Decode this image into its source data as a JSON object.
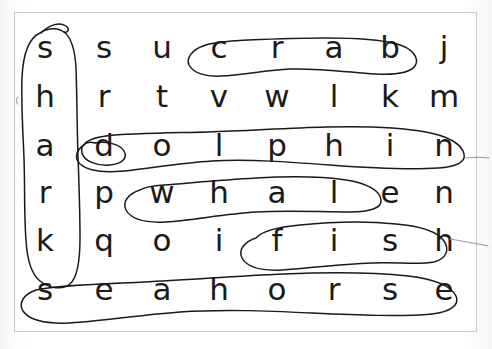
{
  "page": {
    "type": "word-search-puzzle",
    "background_color": "#ffffff",
    "border_color": "#c9c9c5",
    "ink_color": "#1a1a1a",
    "letter_color": "#1b1b1b"
  },
  "grid": {
    "rows": 6,
    "columns": 8,
    "letters": [
      [
        "s",
        "s",
        "u",
        "c",
        "r",
        "a",
        "b",
        "j"
      ],
      [
        "h",
        "r",
        "t",
        "v",
        "w",
        "l",
        "k",
        "m"
      ],
      [
        "a",
        "d",
        "o",
        "l",
        "p",
        "h",
        "i",
        "n"
      ],
      [
        "r",
        "p",
        "w",
        "h",
        "a",
        "l",
        "e",
        "n"
      ],
      [
        "k",
        "q",
        "o",
        "i",
        "f",
        "i",
        "s",
        "h"
      ],
      [
        "s",
        "e",
        "a",
        "h",
        "o",
        "r",
        "s",
        "e"
      ]
    ],
    "row_labels": [
      "row-1",
      "row-2",
      "row-3",
      "row-4",
      "row-5",
      "row-6"
    ],
    "column_positions": [
      45,
      104,
      162,
      219,
      277,
      334,
      390,
      444
    ],
    "row_positions": [
      47,
      96,
      145,
      192,
      240,
      289
    ]
  },
  "found_words": [
    {
      "word": "shark",
      "direction": "vertical",
      "start": {
        "row": 1,
        "column": 1
      },
      "end": {
        "row": 5,
        "column": 1
      },
      "marking": "hand-drawn-ellipse"
    },
    {
      "word": "crab",
      "direction": "horizontal",
      "start": {
        "row": 1,
        "column": 4
      },
      "end": {
        "row": 1,
        "column": 7
      },
      "marking": "hand-drawn-ellipse"
    },
    {
      "word": "dolphin",
      "direction": "horizontal",
      "start": {
        "row": 3,
        "column": 2
      },
      "end": {
        "row": 3,
        "column": 8
      },
      "marking": "hand-drawn-ellipse"
    },
    {
      "word": "whale",
      "direction": "horizontal",
      "start": {
        "row": 4,
        "column": 3
      },
      "end": {
        "row": 4,
        "column": 7
      },
      "marking": "hand-drawn-ellipse"
    },
    {
      "word": "fish",
      "direction": "horizontal",
      "start": {
        "row": 5,
        "column": 5
      },
      "end": {
        "row": 5,
        "column": 8
      },
      "marking": "hand-drawn-ellipse"
    },
    {
      "word": "seahorse",
      "direction": "horizontal",
      "start": {
        "row": 6,
        "column": 1
      },
      "end": {
        "row": 6,
        "column": 8
      },
      "marking": "hand-drawn-ellipse"
    }
  ]
}
